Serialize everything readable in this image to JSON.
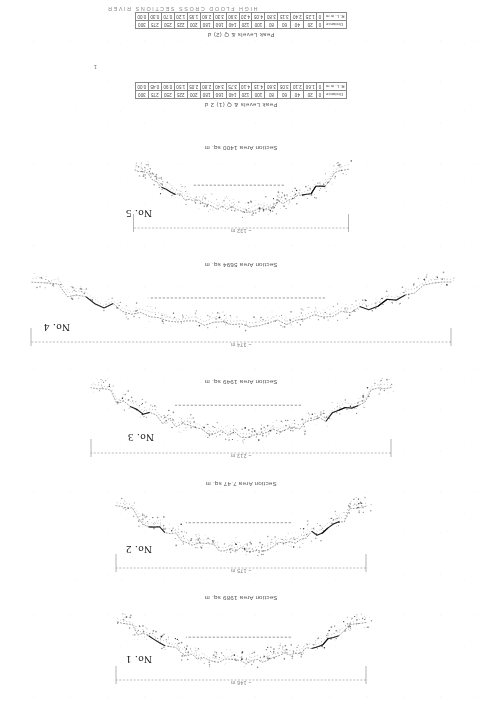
{
  "document": {
    "header_text": "HIGH FLOOD CROSS SECTIONS  RIVER",
    "orientation_note": "rotated-180"
  },
  "sections": [
    {
      "id": "no-1",
      "label": "No. 1",
      "area_text": "Section Area 1989 sq. m",
      "span_text": "~ 146 m",
      "top": 18,
      "height": 100,
      "label_x": 330,
      "label_y": 40,
      "area_y": 104,
      "span_y": 18,
      "width_px": 250,
      "depth_px": 40
    },
    {
      "id": "no-2",
      "label": "No. 2",
      "area_text": "Section Area 7.47 sq. m",
      "span_text": "~ 175 m",
      "top": 130,
      "height": 100,
      "label_x": 330,
      "label_y": 150,
      "area_y": 218,
      "span_y": 130,
      "width_px": 250,
      "depth_px": 44
    },
    {
      "id": "no-3",
      "label": "No. 3",
      "area_text": "Section Area 1949 sq. m",
      "span_text": "~ 213 m",
      "top": 245,
      "height": 92,
      "label_x": 328,
      "label_y": 262,
      "area_y": 320,
      "span_y": 245,
      "width_px": 300,
      "depth_px": 48
    },
    {
      "id": "no-4",
      "label": "No. 4",
      "area_text": "Section Area 5694 sq. m",
      "span_text": "~ 374 m",
      "top": 356,
      "height": 96,
      "label_x": 412,
      "label_y": 372,
      "area_y": 437,
      "span_y": 357,
      "width_px": 420,
      "depth_px": 42
    },
    {
      "id": "no-5",
      "label": "No. 5",
      "area_text": "Section Area 1400 sq. m",
      "span_text": "~ 132 m",
      "top": 470,
      "height": 92,
      "label_x": 330,
      "label_y": 486,
      "area_y": 554,
      "span_y": 470,
      "width_px": 215,
      "depth_px": 40
    }
  ],
  "tables": [
    {
      "id": "table-1",
      "title": "Peak Levels & Q (1) 2   d",
      "top": 598,
      "row_label_top": "Distance",
      "row_label_bottom": "R. L. in m",
      "columns": [
        {
          "top": "0",
          "bottom": "0"
        },
        {
          "top": "20",
          "bottom": "1.60"
        },
        {
          "top": "40",
          "bottom": "2.10"
        },
        {
          "top": "60",
          "bottom": "3.05"
        },
        {
          "top": "80",
          "bottom": "3.60"
        },
        {
          "top": "100",
          "bottom": "4.15"
        },
        {
          "top": "120",
          "bottom": "4.10"
        },
        {
          "top": "140",
          "bottom": "3.75"
        },
        {
          "top": "160",
          "bottom": "3.40"
        },
        {
          "top": "180",
          "bottom": "2.80"
        },
        {
          "top": "200",
          "bottom": "2.05"
        },
        {
          "top": "225",
          "bottom": "1.50"
        },
        {
          "top": "250",
          "bottom": "0.90"
        },
        {
          "top": "275",
          "bottom": "0.45"
        },
        {
          "top": "300",
          "bottom": "0.00"
        }
      ]
    },
    {
      "id": "table-2",
      "title": "Peak Levels & Q (2)  d",
      "top": 668,
      "row_label_top": "Distance",
      "row_label_bottom": "R. L. in m",
      "columns": [
        {
          "top": "0",
          "bottom": "0"
        },
        {
          "top": "20",
          "bottom": "1.25"
        },
        {
          "top": "40",
          "bottom": "2.40"
        },
        {
          "top": "60",
          "bottom": "3.15"
        },
        {
          "top": "80",
          "bottom": "3.80"
        },
        {
          "top": "100",
          "bottom": "4.05"
        },
        {
          "top": "120",
          "bottom": "4.20"
        },
        {
          "top": "140",
          "bottom": "3.90"
        },
        {
          "top": "160",
          "bottom": "3.30"
        },
        {
          "top": "180",
          "bottom": "2.60"
        },
        {
          "top": "200",
          "bottom": "1.95"
        },
        {
          "top": "225",
          "bottom": "1.20"
        },
        {
          "top": "250",
          "bottom": "0.70"
        },
        {
          "top": "275",
          "bottom": "0.30"
        },
        {
          "top": "300",
          "bottom": "0.00"
        }
      ]
    }
  ],
  "stray": {
    "mark_1": "1"
  },
  "colors": {
    "ink": "#1b1b1b",
    "faded_ink": "#3d3d3d",
    "paper": "#ffffff",
    "rule": "#888888"
  }
}
